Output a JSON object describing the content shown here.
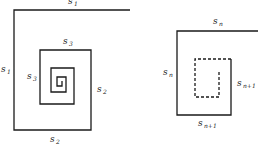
{
  "diagram": {
    "type": "spiral-geometric-construction",
    "stroke_color": "#1a1a1a",
    "left_figure": {
      "description": "Inward square spiral with segment lengths s1, s1, s2, s2, s3, s3, ...",
      "labels": [
        {
          "id": "top",
          "base": "s",
          "sub": "1"
        },
        {
          "id": "left",
          "base": "s",
          "sub": "1"
        },
        {
          "id": "bottom",
          "base": "s",
          "sub": "2"
        },
        {
          "id": "right",
          "base": "s",
          "sub": "2"
        },
        {
          "id": "inner-top",
          "base": "s",
          "sub": "3"
        },
        {
          "id": "inner-left",
          "base": "s",
          "sub": "3"
        }
      ]
    },
    "right_figure": {
      "description": "Generic step: sides s_n, s_n then s_{n+1}, s_{n+1}, continuing dashed",
      "labels": [
        {
          "id": "top",
          "base": "s",
          "sub": "n"
        },
        {
          "id": "left",
          "base": "s",
          "sub": "n"
        },
        {
          "id": "right",
          "base": "s",
          "sub": "n+1"
        },
        {
          "id": "bottom",
          "base": "s",
          "sub": "n+1"
        }
      ]
    }
  }
}
